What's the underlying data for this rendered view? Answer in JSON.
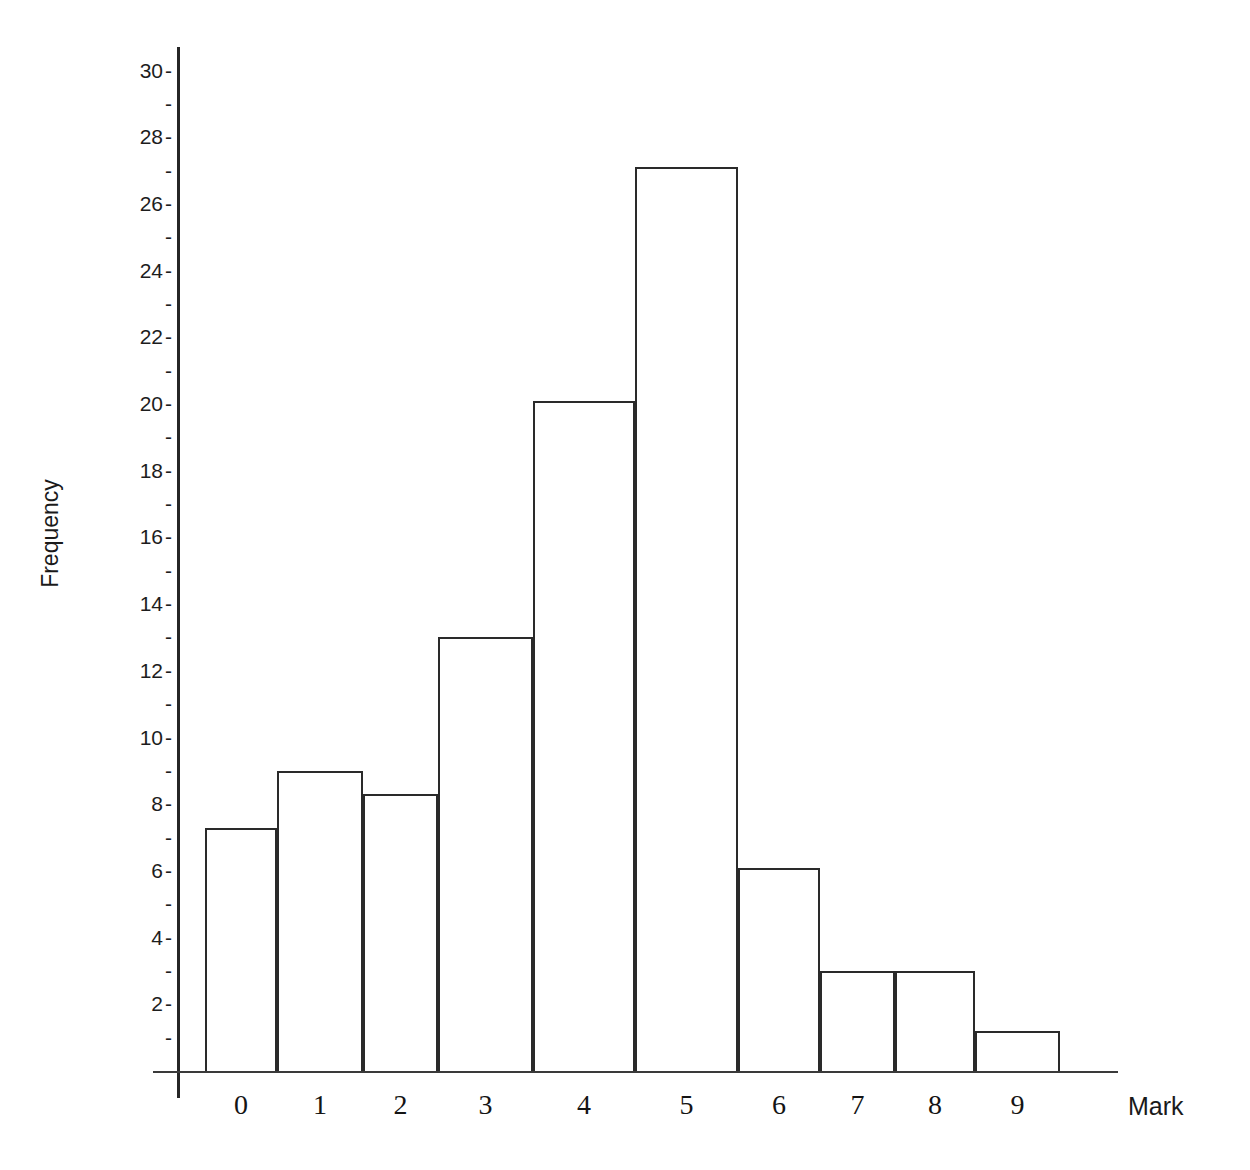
{
  "chart_data": {
    "type": "bar",
    "title": "",
    "xlabel": "Mark",
    "ylabel": "Frequency",
    "categories": [
      "0",
      "1",
      "2",
      "3",
      "4",
      "5",
      "6",
      "7",
      "8",
      "9"
    ],
    "values": [
      7.3,
      9,
      8.3,
      13,
      20.1,
      27.1,
      6.1,
      3,
      3,
      1.2
    ],
    "ylim": [
      0,
      31
    ],
    "y_major_ticks": [
      2,
      4,
      6,
      8,
      10,
      12,
      14,
      16,
      18,
      20,
      22,
      24,
      26,
      28,
      30
    ],
    "y_minor_ticks": [
      1,
      3,
      5,
      7,
      9,
      11,
      13,
      15,
      17,
      19,
      21,
      23,
      25,
      27,
      29
    ],
    "grid": false,
    "legend": false,
    "bar_style": "outline",
    "bar_fill": "#ffffff",
    "bar_stroke": "#2a2a2a",
    "axis_color": "#262626"
  },
  "axes": {
    "y_title": "Frequency",
    "x_title": "Mark",
    "y_labels": [
      {
        "value": 30,
        "text": "30",
        "major": true
      },
      {
        "value": 29,
        "text": "",
        "major": false
      },
      {
        "value": 28,
        "text": "28",
        "major": true
      },
      {
        "value": 27,
        "text": "",
        "major": false
      },
      {
        "value": 26,
        "text": "26",
        "major": true
      },
      {
        "value": 25,
        "text": "",
        "major": false
      },
      {
        "value": 24,
        "text": "24",
        "major": true
      },
      {
        "value": 23,
        "text": "",
        "major": false
      },
      {
        "value": 22,
        "text": "22",
        "major": true
      },
      {
        "value": 21,
        "text": "",
        "major": false
      },
      {
        "value": 20,
        "text": "20",
        "major": true
      },
      {
        "value": 19,
        "text": "",
        "major": false
      },
      {
        "value": 18,
        "text": "18",
        "major": true
      },
      {
        "value": 17,
        "text": "",
        "major": false
      },
      {
        "value": 16,
        "text": "16",
        "major": true
      },
      {
        "value": 15,
        "text": "",
        "major": false
      },
      {
        "value": 14,
        "text": "14",
        "major": true
      },
      {
        "value": 13,
        "text": "",
        "major": false
      },
      {
        "value": 12,
        "text": "12",
        "major": true
      },
      {
        "value": 11,
        "text": "",
        "major": false
      },
      {
        "value": 10,
        "text": "10",
        "major": true
      },
      {
        "value": 9,
        "text": "",
        "major": false
      },
      {
        "value": 8,
        "text": "8",
        "major": true
      },
      {
        "value": 7,
        "text": "",
        "major": false
      },
      {
        "value": 6,
        "text": "6",
        "major": true
      },
      {
        "value": 5,
        "text": "",
        "major": false
      },
      {
        "value": 4,
        "text": "4",
        "major": true
      },
      {
        "value": 3,
        "text": "",
        "major": false
      },
      {
        "value": 2,
        "text": "2",
        "major": true
      },
      {
        "value": 1,
        "text": "",
        "major": false
      }
    ],
    "tick_glyph": "-",
    "x_labels": [
      "0",
      "1",
      "2",
      "3",
      "4",
      "5",
      "6",
      "7",
      "8",
      "9"
    ]
  },
  "geometry": {
    "baseline_y": 1071,
    "px_per_unit": 33.35,
    "bar_edges_x": [
      205,
      277,
      363,
      438,
      533,
      635,
      738,
      820,
      895,
      975,
      1060
    ]
  }
}
